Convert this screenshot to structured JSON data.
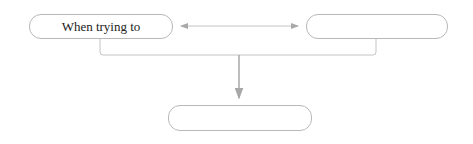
{
  "diagram": {
    "nodes": [
      {
        "id": "left",
        "label": "When trying to"
      },
      {
        "id": "right",
        "label": ""
      },
      {
        "id": "bottom",
        "label": ""
      }
    ],
    "edges": [
      {
        "from": "left",
        "to": "right",
        "type": "bidirectional-arrow"
      },
      {
        "from": "left+right",
        "to": "bottom",
        "type": "merge-arrow"
      }
    ],
    "colors": {
      "line": "#b8b8b8",
      "arrow": "#a8a8a8",
      "text": "#222222"
    }
  }
}
